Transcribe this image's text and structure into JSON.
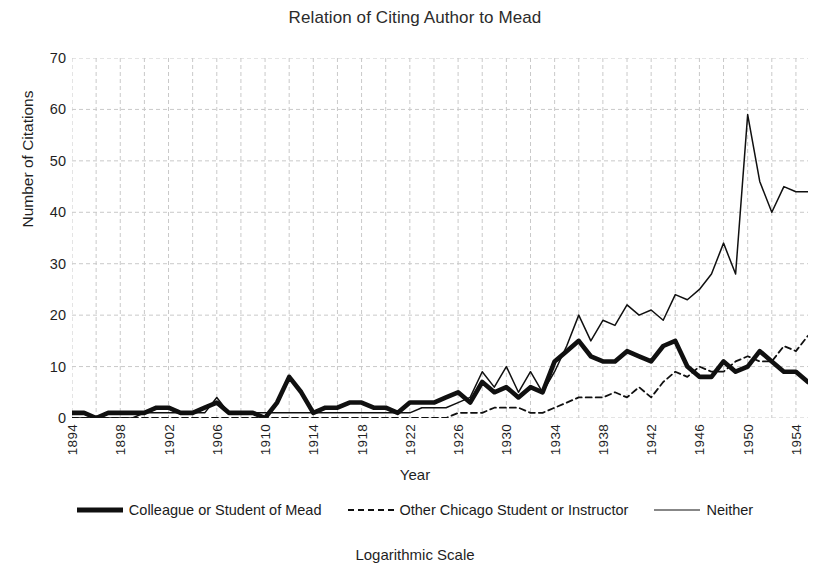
{
  "chart_data": {
    "type": "line",
    "title": "Relation of Citing Author to Mead",
    "xlabel": "Year",
    "ylabel": "Number of Citations",
    "subcaption": "Logarithmic Scale",
    "xlim": [
      1894,
      1955
    ],
    "ylim": [
      0,
      70
    ],
    "yticks": [
      0,
      10,
      20,
      30,
      40,
      50,
      60,
      70
    ],
    "xticks": [
      1894,
      1898,
      1902,
      1906,
      1910,
      1914,
      1918,
      1922,
      1926,
      1930,
      1934,
      1938,
      1942,
      1946,
      1950,
      1954
    ],
    "grid": true,
    "grid_style": "dashed",
    "grid_x_step": 2,
    "legend_position": "bottom",
    "x": [
      1894,
      1895,
      1896,
      1897,
      1898,
      1899,
      1900,
      1901,
      1902,
      1903,
      1904,
      1905,
      1906,
      1907,
      1908,
      1909,
      1910,
      1911,
      1912,
      1913,
      1914,
      1915,
      1916,
      1917,
      1918,
      1919,
      1920,
      1921,
      1922,
      1923,
      1924,
      1925,
      1926,
      1927,
      1928,
      1929,
      1930,
      1931,
      1932,
      1933,
      1934,
      1935,
      1936,
      1937,
      1938,
      1939,
      1940,
      1941,
      1942,
      1943,
      1944,
      1945,
      1946,
      1947,
      1948,
      1949,
      1950,
      1951,
      1952,
      1953,
      1954,
      1955
    ],
    "series": [
      {
        "name": "Colleague or Student of Mead",
        "style": "thick-solid",
        "color": "#101010",
        "values": [
          1,
          1,
          0,
          1,
          1,
          1,
          1,
          2,
          2,
          1,
          1,
          2,
          3,
          1,
          1,
          1,
          0,
          3,
          8,
          5,
          1,
          2,
          2,
          3,
          3,
          2,
          2,
          1,
          3,
          3,
          3,
          4,
          5,
          3,
          7,
          5,
          6,
          4,
          6,
          5,
          11,
          13,
          15,
          12,
          11,
          11,
          13,
          12,
          11,
          14,
          15,
          10,
          8,
          8,
          11,
          9,
          10,
          13,
          11,
          9,
          9,
          7
        ]
      },
      {
        "name": "Other Chicago Student or Instructor",
        "style": "dashed",
        "color": "#101010",
        "values": [
          0,
          0,
          0,
          0,
          0,
          0,
          0,
          0,
          0,
          0,
          0,
          0,
          0,
          0,
          0,
          0,
          0,
          0,
          0,
          0,
          0,
          0,
          0,
          0,
          0,
          0,
          0,
          0,
          0,
          0,
          0,
          0,
          1,
          1,
          1,
          2,
          2,
          2,
          1,
          1,
          2,
          3,
          4,
          4,
          4,
          5,
          4,
          6,
          4,
          7,
          9,
          8,
          10,
          9,
          9,
          11,
          12,
          11,
          11,
          14,
          13,
          16
        ]
      },
      {
        "name": "Neither",
        "style": "thin-solid",
        "color": "#101010",
        "values": [
          0,
          0,
          0,
          0,
          0,
          0,
          1,
          1,
          1,
          1,
          1,
          1,
          4,
          1,
          1,
          1,
          1,
          1,
          1,
          1,
          1,
          1,
          1,
          1,
          1,
          1,
          1,
          1,
          1,
          2,
          2,
          2,
          3,
          4,
          9,
          6,
          10,
          5,
          9,
          5,
          9,
          14,
          20,
          15,
          19,
          18,
          22,
          20,
          21,
          19,
          24,
          23,
          25,
          28,
          34,
          28,
          59,
          46,
          40,
          45,
          44,
          44
        ]
      }
    ]
  },
  "legend": {
    "items": [
      {
        "label": "Colleague or Student of Mead",
        "swatch": "thick-solid-line-icon"
      },
      {
        "label": "Other Chicago Student or Instructor",
        "swatch": "dashed-line-icon"
      },
      {
        "label": "Neither",
        "swatch": "thin-solid-line-icon"
      }
    ]
  },
  "colors": {
    "line": "#101010",
    "grid": "#c9c9c9",
    "text": "#1f1f1f",
    "background": "#ffffff"
  }
}
